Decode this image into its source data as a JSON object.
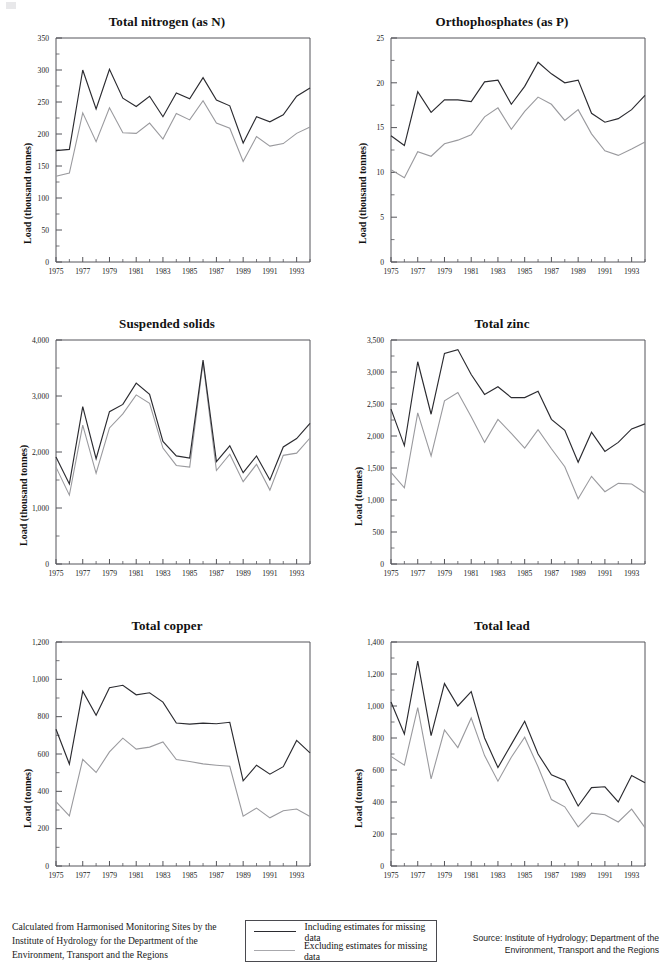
{
  "page": {
    "note_left": "Calculated from Harmonised Monitoring Sites by the Institute of Hydrology for the Department of the Environment, Transport and the Regions",
    "note_right": "Source: Institute of Hydrology; Department of the Environment, Transport and the Regions"
  },
  "legend": {
    "including_label": "Including estimates for missing data",
    "excluding_label": "Excluding estimates for missing data",
    "including_color": "#2b2b30",
    "excluding_color": "#9a9a9e"
  },
  "chart_data": [
    {
      "type": "line",
      "title": "Total nitrogen (as N)",
      "xlabel": "",
      "ylabel": "Load (thousand tonnes)",
      "ylim": [
        0,
        350
      ],
      "ytick_step": 50,
      "ytick_labels": [
        "0",
        "50",
        "100",
        "150",
        "200",
        "250",
        "300",
        "350"
      ],
      "xlim": [
        1975,
        1994
      ],
      "xtick_labels": [
        "1975",
        "1977",
        "1979",
        "1981",
        "1983",
        "1985",
        "1987",
        "1989",
        "1991",
        "1993"
      ],
      "x": [
        1975,
        1976,
        1977,
        1978,
        1979,
        1980,
        1981,
        1982,
        1983,
        1984,
        1985,
        1986,
        1987,
        1988,
        1989,
        1990,
        1991,
        1992,
        1993,
        1994
      ],
      "grid": false,
      "legend_position": "external-bottom",
      "series": [
        {
          "name": "Including estimates for missing data",
          "values": [
            174,
            176,
            300,
            239,
            301,
            256,
            243,
            259,
            227,
            264,
            255,
            288,
            253,
            244,
            186,
            227,
            219,
            230,
            259,
            272
          ]
        },
        {
          "name": "Excluding estimates for missing data",
          "values": [
            134,
            139,
            233,
            188,
            241,
            202,
            201,
            217,
            192,
            232,
            222,
            252,
            217,
            209,
            157,
            196,
            181,
            185,
            201,
            211
          ]
        }
      ]
    },
    {
      "type": "line",
      "title": "Orthophosphates (as P)",
      "xlabel": "",
      "ylabel": "Load (thousand tonnes)",
      "ylim": [
        0,
        25
      ],
      "ytick_step": 5,
      "ytick_labels": [
        "0",
        "5",
        "10",
        "15",
        "20",
        "25"
      ],
      "xlim": [
        1975,
        1994
      ],
      "xtick_labels": [
        "1975",
        "1977",
        "1979",
        "1981",
        "1983",
        "1985",
        "1987",
        "1989",
        "1991",
        "1993"
      ],
      "x": [
        1975,
        1976,
        1977,
        1978,
        1979,
        1980,
        1981,
        1982,
        1983,
        1984,
        1985,
        1986,
        1987,
        1988,
        1989,
        1990,
        1991,
        1992,
        1993,
        1994
      ],
      "grid": false,
      "legend_position": "external-bottom",
      "series": [
        {
          "name": "Including estimates for missing data",
          "values": [
            14.1,
            13.0,
            19.0,
            16.7,
            18.1,
            18.1,
            17.9,
            20.1,
            20.3,
            17.6,
            19.6,
            22.3,
            21.0,
            20.0,
            20.3,
            16.6,
            15.6,
            16.0,
            17.0,
            18.6
          ]
        },
        {
          "name": "Excluding estimates for missing data",
          "values": [
            10.3,
            9.4,
            12.3,
            11.8,
            13.2,
            13.6,
            14.2,
            16.2,
            17.2,
            14.8,
            16.8,
            18.4,
            17.6,
            15.8,
            17.0,
            14.3,
            12.4,
            11.9,
            12.6,
            13.4
          ]
        }
      ]
    },
    {
      "type": "line",
      "title": "Suspended solids",
      "xlabel": "",
      "ylabel": "Load (thousand tonnes)",
      "ylim": [
        0,
        4000
      ],
      "ytick_step": 1000,
      "ytick_labels": [
        "0",
        "1,000",
        "2,000",
        "3,000",
        "4,000"
      ],
      "xlim": [
        1975,
        1994
      ],
      "xtick_labels": [
        "1975",
        "1977",
        "1979",
        "1981",
        "1983",
        "1985",
        "1987",
        "1989",
        "1991",
        "1993"
      ],
      "x": [
        1975,
        1976,
        1977,
        1978,
        1979,
        1980,
        1981,
        1982,
        1983,
        1984,
        1985,
        1986,
        1987,
        1988,
        1989,
        1990,
        1991,
        1992,
        1993,
        1994
      ],
      "grid": false,
      "legend_position": "external-bottom",
      "series": [
        {
          "name": "Including estimates for missing data",
          "values": [
            1910,
            1430,
            2810,
            1880,
            2720,
            2850,
            3230,
            3030,
            2190,
            1930,
            1890,
            3640,
            1830,
            2110,
            1630,
            1930,
            1500,
            2090,
            2240,
            2510
          ]
        },
        {
          "name": "Excluding estimates for missing data",
          "values": [
            1730,
            1230,
            2480,
            1620,
            2430,
            2680,
            3020,
            2870,
            2070,
            1760,
            1730,
            3600,
            1670,
            1960,
            1470,
            1780,
            1320,
            1940,
            1980,
            2250
          ]
        }
      ]
    },
    {
      "type": "line",
      "title": "Total zinc",
      "xlabel": "",
      "ylabel": "Load (tonnes)",
      "ylim": [
        0,
        3500
      ],
      "ytick_step": 500,
      "ytick_labels": [
        "0",
        "500",
        "1,000",
        "1,500",
        "2,000",
        "2,500",
        "3,000",
        "3,500"
      ],
      "xlim": [
        1975,
        1994
      ],
      "xtick_labels": [
        "1975",
        "1977",
        "1979",
        "1981",
        "1983",
        "1985",
        "1987",
        "1989",
        "1991",
        "1993"
      ],
      "x": [
        1975,
        1976,
        1977,
        1978,
        1979,
        1980,
        1981,
        1982,
        1983,
        1984,
        1985,
        1986,
        1987,
        1988,
        1989,
        1990,
        1991,
        1992,
        1993,
        1994
      ],
      "grid": false,
      "legend_position": "external-bottom",
      "series": [
        {
          "name": "Including estimates for missing data",
          "values": [
            2420,
            1850,
            3160,
            2340,
            3290,
            3350,
            2960,
            2650,
            2770,
            2600,
            2600,
            2700,
            2260,
            2090,
            1590,
            2060,
            1760,
            1900,
            2110,
            2190
          ]
        },
        {
          "name": "Excluding estimates for missing data",
          "values": [
            1430,
            1190,
            2360,
            1690,
            2550,
            2680,
            2300,
            1900,
            2260,
            2040,
            1810,
            2100,
            1800,
            1520,
            1020,
            1370,
            1130,
            1260,
            1250,
            1110
          ]
        }
      ]
    },
    {
      "type": "line",
      "title": "Total copper",
      "xlabel": "",
      "ylabel": "Load (tonnes)",
      "ylim": [
        0,
        1200
      ],
      "ytick_step": 200,
      "ytick_labels": [
        "0",
        "200",
        "400",
        "600",
        "800",
        "1,000",
        "1,200"
      ],
      "xlim": [
        1975,
        1994
      ],
      "xtick_labels": [
        "1975",
        "1977",
        "1979",
        "1981",
        "1983",
        "1985",
        "1987",
        "1989",
        "1991",
        "1993"
      ],
      "x": [
        1975,
        1976,
        1977,
        1978,
        1979,
        1980,
        1981,
        1982,
        1983,
        1984,
        1985,
        1986,
        1987,
        1988,
        1989,
        1990,
        1991,
        1992,
        1993,
        1994
      ],
      "grid": false,
      "legend_position": "external-bottom",
      "series": [
        {
          "name": "Including estimates for missing data",
          "values": [
            733,
            546,
            936,
            808,
            955,
            968,
            917,
            928,
            878,
            766,
            760,
            765,
            762,
            770,
            456,
            540,
            492,
            532,
            673,
            606
          ]
        },
        {
          "name": "Excluding estimates for missing data",
          "values": [
            345,
            268,
            571,
            501,
            611,
            685,
            626,
            637,
            665,
            570,
            560,
            547,
            540,
            534,
            267,
            310,
            258,
            296,
            305,
            265
          ]
        }
      ]
    },
    {
      "type": "line",
      "title": "Total lead",
      "xlabel": "",
      "ylabel": "Load (tonnes)",
      "ylim": [
        0,
        1400
      ],
      "ytick_step": 200,
      "ytick_labels": [
        "0",
        "200",
        "400",
        "600",
        "800",
        "1,000",
        "1,200",
        "1,400"
      ],
      "xlim": [
        1975,
        1994
      ],
      "xtick_labels": [
        "1975",
        "1977",
        "1979",
        "1981",
        "1983",
        "1985",
        "1987",
        "1989",
        "1991",
        "1993"
      ],
      "x": [
        1975,
        1976,
        1977,
        1978,
        1979,
        1980,
        1981,
        1982,
        1983,
        1984,
        1985,
        1986,
        1987,
        1988,
        1989,
        1990,
        1991,
        1992,
        1993,
        1994
      ],
      "grid": false,
      "legend_position": "external-bottom",
      "series": [
        {
          "name": "Including estimates for missing data",
          "values": [
            1025,
            825,
            1280,
            815,
            1140,
            1000,
            1090,
            800,
            615,
            760,
            905,
            700,
            570,
            535,
            375,
            490,
            495,
            400,
            565,
            520
          ]
        },
        {
          "name": "Excluding estimates for missing data",
          "values": [
            685,
            630,
            990,
            545,
            850,
            740,
            925,
            690,
            530,
            680,
            805,
            620,
            415,
            370,
            245,
            330,
            320,
            275,
            355,
            240
          ]
        }
      ]
    }
  ]
}
